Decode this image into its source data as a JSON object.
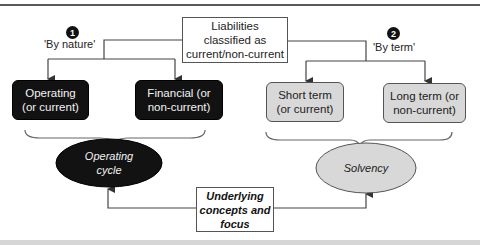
{
  "diagram": {
    "root": {
      "label": "Liabilities classified as current/non-current",
      "lines": [
        "Liabilities",
        "classified as",
        "current/non-current"
      ]
    },
    "branches": [
      {
        "badge": "1",
        "label": "'By nature'",
        "children": [
          {
            "lines": [
              "Operating",
              "(or current)"
            ],
            "style": "dark"
          },
          {
            "lines": [
              "Financial (or",
              "non-current)"
            ],
            "style": "dark"
          }
        ],
        "concept": {
          "lines": [
            "Operating",
            "cycle"
          ],
          "style": "dark"
        }
      },
      {
        "badge": "2",
        "label": "'By term'",
        "children": [
          {
            "lines": [
              "Short term",
              "(or current)"
            ],
            "style": "light"
          },
          {
            "lines": [
              "Long term (or",
              "non-current)"
            ],
            "style": "light"
          }
        ],
        "concept": {
          "lines": [
            "Solvency"
          ],
          "style": "light"
        }
      }
    ],
    "focus_box": {
      "lines": [
        "Underlying",
        "concepts and",
        "focus"
      ]
    },
    "colors": {
      "dark_fill": "#121212",
      "light_fill": "#d8d8d8",
      "line": "#444444",
      "text_dark": "#222222",
      "text_light": "#f2f2f2"
    }
  }
}
